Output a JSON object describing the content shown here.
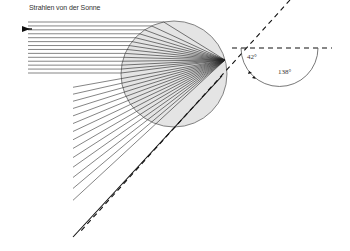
{
  "diagram": {
    "title": "Strahlen von der Sonne",
    "labels": {
      "angle_small": "42°",
      "angle_large": "138°"
    },
    "colors": {
      "circle_fill": "#e4e4e4",
      "circle_stroke": "#666666",
      "ray_stroke": "#333333",
      "dashed_stroke": "#111111",
      "background": "#ffffff"
    },
    "droplet": {
      "cx": 174,
      "cy": 74,
      "r": 53
    },
    "convergence_point": {
      "x": 225,
      "y": 60
    },
    "incoming_ray_count": 14,
    "outgoing_ray_count": 14,
    "incoming_arrow": "arrow-right"
  }
}
